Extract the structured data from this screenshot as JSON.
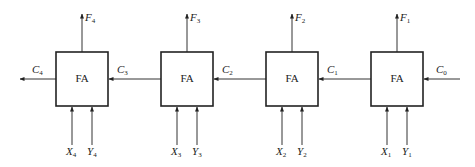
{
  "diagram": {
    "block_label": "FA",
    "stages": [
      {
        "id": 4,
        "x": 56,
        "F": "F",
        "F_sub": "4",
        "X": "X",
        "X_sub": "4",
        "Y": "Y",
        "Y_sub": "4",
        "Cout": "C",
        "Cout_sub": "4"
      },
      {
        "id": 3,
        "x": 161,
        "F": "F",
        "F_sub": "3",
        "X": "X",
        "X_sub": "3",
        "Y": "Y",
        "Y_sub": "3",
        "Cout": "C",
        "Cout_sub": "3"
      },
      {
        "id": 2,
        "x": 266,
        "F": "F",
        "F_sub": "2",
        "X": "X",
        "X_sub": "2",
        "Y": "Y",
        "Y_sub": "2",
        "Cout": "C",
        "Cout_sub": "2"
      },
      {
        "id": 1,
        "x": 371,
        "F": "F",
        "F_sub": "1",
        "X": "X",
        "X_sub": "1",
        "Y": "Y",
        "Y_sub": "1",
        "Cout": "C",
        "Cout_sub": "1"
      }
    ],
    "carry_in": {
      "label": "C",
      "sub": "0"
    },
    "colors": {
      "line": "#333333",
      "box": "#222222"
    }
  }
}
